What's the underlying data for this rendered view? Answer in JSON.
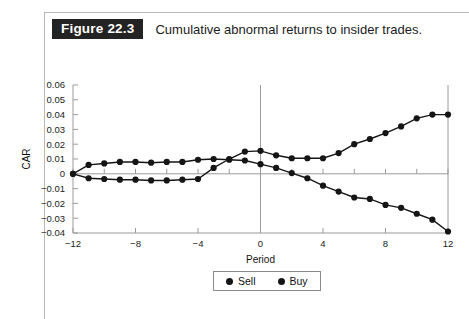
{
  "figure": {
    "badge": "Figure 22.3",
    "caption": "Cumulative abnormal returns to insider trades."
  },
  "legend": {
    "items": [
      {
        "label": "Sell",
        "marker": "filled-circle",
        "color": "#151515"
      },
      {
        "label": "Buy",
        "marker": "filled-circle",
        "color": "#151515"
      }
    ]
  },
  "chart_data": {
    "type": "line",
    "title": "Cumulative abnormal returns to insider trades.",
    "xlabel": "Period",
    "ylabel": "CAR",
    "xlim": [
      -12,
      12
    ],
    "ylim": [
      -0.04,
      0.06
    ],
    "xticks": [
      -12,
      -8,
      -4,
      0,
      4,
      8,
      12
    ],
    "xtick_labels": [
      "−12",
      "−8",
      "−4",
      "0",
      "4",
      "8",
      "12"
    ],
    "xminor_step": 2,
    "yticks": [
      -0.04,
      -0.03,
      -0.02,
      -0.01,
      0,
      0.01,
      0.02,
      0.03,
      0.04,
      0.05,
      0.06
    ],
    "ytick_labels": [
      "−0.04",
      "−0.03",
      "−0.02",
      "−0.01",
      "0",
      "0.01",
      "0.02",
      "0.03",
      "0.04",
      "0.05",
      "0.06"
    ],
    "grid": false,
    "zero_line_x": 0,
    "zero_line_y": 0,
    "legend_position": "below-center",
    "marker": "filled-circle",
    "x": [
      -12,
      -11,
      -10,
      -9,
      -8,
      -7,
      -6,
      -5,
      -4,
      -3,
      -2,
      -1,
      0,
      1,
      2,
      3,
      4,
      5,
      6,
      7,
      8,
      9,
      10,
      11,
      12
    ],
    "series": [
      {
        "name": "Sell",
        "color": "#151515",
        "values": [
          0.0,
          0.006,
          0.007,
          0.008,
          0.008,
          0.0075,
          0.008,
          0.008,
          0.0095,
          0.01,
          0.0095,
          0.009,
          0.0065,
          0.004,
          0.0005,
          -0.003,
          -0.008,
          -0.012,
          -0.016,
          -0.017,
          -0.021,
          -0.023,
          -0.027,
          -0.031,
          -0.039
        ]
      },
      {
        "name": "Buy",
        "color": "#151515",
        "values": [
          0.0,
          -0.003,
          -0.0035,
          -0.004,
          -0.004,
          -0.0045,
          -0.0045,
          -0.004,
          -0.0035,
          0.004,
          0.01,
          0.015,
          0.0155,
          0.0125,
          0.0105,
          0.0105,
          0.0105,
          0.014,
          0.02,
          0.0235,
          0.0275,
          0.032,
          0.0375,
          0.04,
          0.04
        ]
      }
    ]
  }
}
